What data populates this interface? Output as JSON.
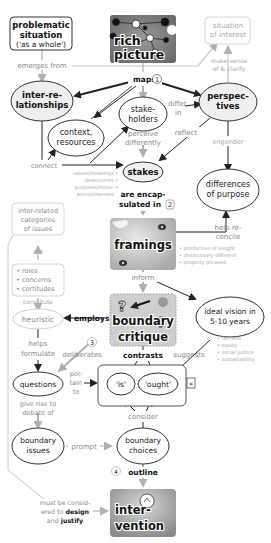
{
  "diagram": {
    "nodes": {
      "problematic_situation": {
        "line1": "problematic",
        "line2": "situation",
        "line3": "('as a whole')"
      },
      "rich_picture": {
        "line1": "rich",
        "line2": "picture"
      },
      "situation_of_interest": {
        "line1": "situation",
        "line2": "of interest"
      },
      "interrelationships": {
        "line1": "inter-re-",
        "line2": "lationships"
      },
      "stakeholders": {
        "line1": "stake-",
        "line2": "holders"
      },
      "perspectives": {
        "line1": "perspec-",
        "line2": "tives"
      },
      "context_resources": {
        "line1": "context,",
        "line2": "resources"
      },
      "stakes": {
        "label": "stakes"
      },
      "differences_of_purpose": {
        "line1": "differences",
        "line2": "of purpose"
      },
      "interrelated_categories": {
        "line1": "inter-related",
        "line2": "categories",
        "line3": "of issues"
      },
      "categories_list": {
        "items": [
          "roles",
          "concerns",
          "certitudes"
        ]
      },
      "framings": {
        "label": "framings"
      },
      "heuristic": {
        "label": "heuristic"
      },
      "boundary_critique": {
        "line1": "boundary",
        "line2": "critique"
      },
      "ideal_vision": {
        "line1": "ideal vision in",
        "line2": "5-10 years"
      },
      "questions": {
        "label": "questions"
      },
      "is": {
        "label": "'is'"
      },
      "ought": {
        "label": "'ought'"
      },
      "boundary_issues": {
        "line1": "boundary",
        "line2": "issues"
      },
      "boundary_choices": {
        "line1": "boundary",
        "line2": "choices"
      },
      "intervention": {
        "line1": "inter-",
        "line2": "vention"
      }
    },
    "links": {
      "emerges_from": "emerges from",
      "maps": "maps",
      "make_sense": {
        "line1": "make sense",
        "line2": "of & clarify"
      },
      "differ_in": {
        "line1": "differ",
        "line2": "in"
      },
      "perceive_differently": {
        "line1": "perceive",
        "line2": "differently"
      },
      "reflect": "reflect",
      "engender": "engender",
      "connect": "connect",
      "are_encapsulated_in": {
        "line1": "are encap-",
        "line2": "sulated in"
      },
      "help_reconcile": {
        "line1": "help re-",
        "line2": "concile"
      },
      "are": "are",
      "constitute": "constitute",
      "inform": "inform",
      "employs": "employs",
      "helps_formulate": {
        "line1": "helps",
        "line2": "formulate"
      },
      "deliberates": "deliberates",
      "contrasts": "contrasts",
      "suggests": "suggests",
      "pertain_to": {
        "line1": "per-",
        "line2": "tain",
        "line3": "to"
      },
      "give_rise": {
        "line1": "give rise to",
        "line2": "debate of"
      },
      "consider": "consider",
      "prompt": "prompt",
      "outline": "outline",
      "must_be_considered": {
        "line1": "must be consid-",
        "line2": "ered to",
        "bold1": "design",
        "line3": "and",
        "bold2": "justify"
      }
    },
    "annotations": {
      "stakes_bullets": [
        "values/meanings",
        "ideas/norms",
        "purposes/motiv-",
        "ations/interests"
      ],
      "framings_bullets": [
        "productive of insight",
        "distinctively different",
        "properly phrased"
      ],
      "vision_bullets": [
        "fairness",
        "equity",
        "social justice",
        "sustainability"
      ]
    },
    "step_numbers": [
      "1",
      "2",
      "3",
      "4"
    ],
    "collapse_glyph": "«"
  },
  "colors": {
    "line_dark": "#222222",
    "line_grey": "#b0b0b0",
    "node_fill": "#f0f0f0",
    "text_grey": "#8a8a8a"
  }
}
